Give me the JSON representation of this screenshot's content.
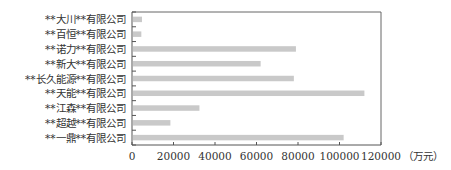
{
  "chart_data": {
    "type": "bar",
    "orientation": "horizontal",
    "title": "",
    "xlabel": "（万元）",
    "ylabel": "",
    "categories": [
      "**大川**有限公司",
      "**百恒**有限公司",
      "**诺力**有限公司",
      "**新大**有限公司",
      "**长久能源**有限公司",
      "**天能**有限公司",
      "**江森**有限公司",
      "**超越**有限公司",
      "**一鼎**有限公司"
    ],
    "values": [
      4800,
      4500,
      79000,
      62000,
      78000,
      112000,
      32500,
      18500,
      102000
    ],
    "xlim": [
      0,
      120000
    ],
    "xticks": [
      0,
      20000,
      40000,
      60000,
      80000,
      100000,
      120000
    ],
    "xtick_labels": [
      "0",
      "20000",
      "40000",
      "60000",
      "80000",
      "100000",
      "120000"
    ],
    "unit_label": "（万元）",
    "grid": false,
    "legend": null,
    "colors": {
      "bar": "#c9c9c9",
      "axis": "#555555",
      "frame": "#666666"
    }
  }
}
